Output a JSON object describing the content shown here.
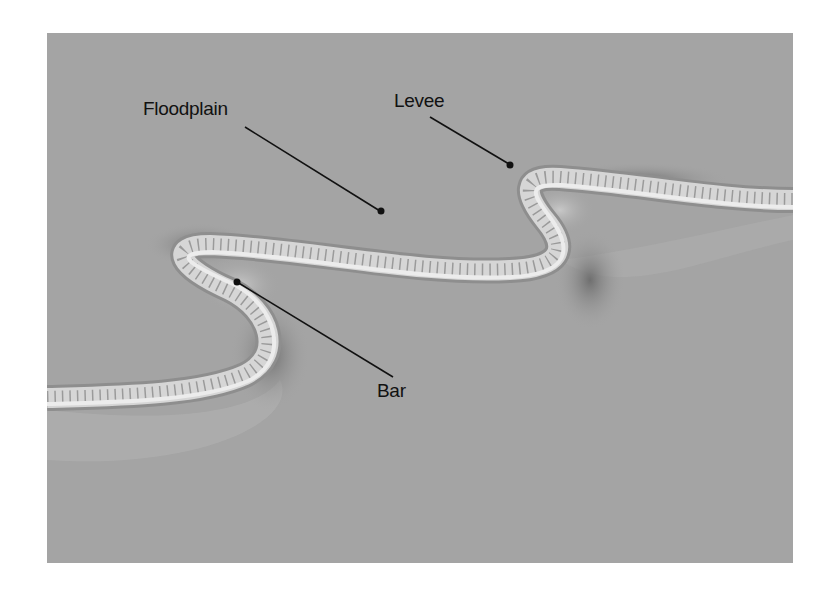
{
  "figure": {
    "labels": {
      "floodplain": "Floodplain",
      "levee": "Levee",
      "bar": "Bar"
    },
    "colors": {
      "background": "#a4a4a4",
      "channel": "#d9d9d9",
      "levee_shadow": "#7a7a7a",
      "label_text": "#111111"
    }
  }
}
